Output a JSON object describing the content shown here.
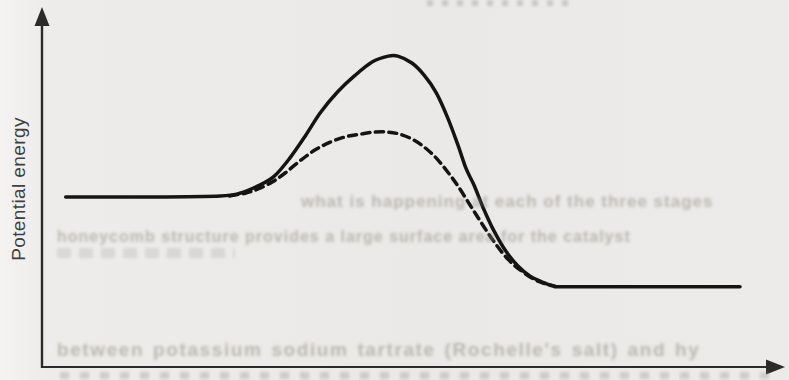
{
  "chart": {
    "ylabel": "Potential energy",
    "xlabel": "",
    "title": ""
  },
  "chart_data": {
    "type": "line",
    "title": "",
    "xlabel": "",
    "ylabel": "Potential energy",
    "xlim": [
      0,
      100
    ],
    "ylim": [
      0,
      100
    ],
    "grid": false,
    "legend": null,
    "axes": {
      "y_axis": "vertical line with upward arrowhead, no ticks, no tick labels",
      "x_axis": "horizontal line with rightward arrowhead, no ticks, no tick labels"
    },
    "series": [
      {
        "name": "solid-curve",
        "style": "solid",
        "color": "#141414",
        "points": [
          [
            0.1,
            49.0
          ],
          [
            12.6,
            49.0
          ],
          [
            23.0,
            49.3
          ],
          [
            25.9,
            50.1
          ],
          [
            28.6,
            52.2
          ],
          [
            31.0,
            55.0
          ],
          [
            33.3,
            60.2
          ],
          [
            35.6,
            66.6
          ],
          [
            37.8,
            73.2
          ],
          [
            40.4,
            79.3
          ],
          [
            43.0,
            84.1
          ],
          [
            45.5,
            87.9
          ],
          [
            47.9,
            89.6
          ],
          [
            49.3,
            89.6
          ],
          [
            51.4,
            87.6
          ],
          [
            53.2,
            84.1
          ],
          [
            55.0,
            79.0
          ],
          [
            56.7,
            71.8
          ],
          [
            58.2,
            64.0
          ],
          [
            59.4,
            57.3
          ],
          [
            60.6,
            52.4
          ],
          [
            61.9,
            46.1
          ],
          [
            63.4,
            39.8
          ],
          [
            65.2,
            33.7
          ],
          [
            67.1,
            29.1
          ],
          [
            68.9,
            26.2
          ],
          [
            70.7,
            24.5
          ],
          [
            72.3,
            23.3
          ],
          [
            74.1,
            23.1
          ],
          [
            86.7,
            23.1
          ],
          [
            100,
            23.1
          ]
        ]
      },
      {
        "name": "dashed-curve",
        "style": "dashed",
        "color": "#141414",
        "points": [
          [
            24.4,
            49.3
          ],
          [
            26.7,
            50.1
          ],
          [
            28.6,
            51.3
          ],
          [
            30.7,
            53.3
          ],
          [
            32.6,
            55.9
          ],
          [
            34.8,
            59.4
          ],
          [
            37.0,
            62.5
          ],
          [
            39.3,
            64.8
          ],
          [
            41.5,
            66.3
          ],
          [
            43.7,
            67.1
          ],
          [
            45.9,
            67.7
          ],
          [
            47.9,
            67.7
          ],
          [
            49.6,
            67.1
          ],
          [
            51.4,
            65.7
          ],
          [
            53.2,
            63.4
          ],
          [
            55.0,
            60.2
          ],
          [
            56.7,
            56.2
          ],
          [
            58.2,
            52.2
          ],
          [
            60.0,
            46.7
          ],
          [
            61.8,
            41.2
          ],
          [
            63.7,
            35.7
          ],
          [
            65.6,
            31.1
          ],
          [
            67.4,
            28.0
          ],
          [
            69.2,
            25.6
          ],
          [
            70.8,
            24.2
          ],
          [
            72.6,
            23.3
          ]
        ]
      }
    ]
  },
  "bleedthrough_text": {
    "line_top": "what is happening at each of the three stages",
    "line_middle": "honeycomb structure provides a large surface area for the catalyst",
    "line_bottom": "between potassium sodium tartrate (Rochelle's salt) and hy"
  },
  "colors": {
    "curve": "#141414",
    "axis": "#2b2b2b",
    "paper": "#eae9e7",
    "bleed_text": "#c3bfb8"
  }
}
